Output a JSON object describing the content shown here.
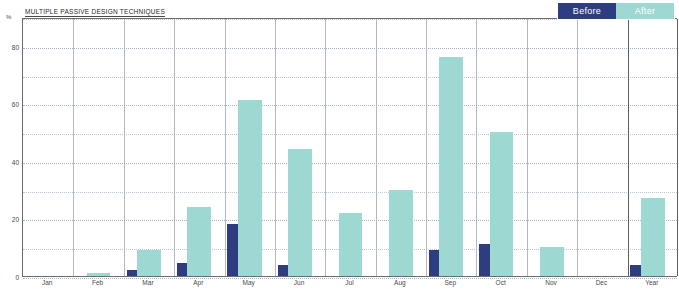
{
  "chart_data": {
    "type": "bar",
    "title": "MULTIPLE PASSIVE DESIGN TECHNIQUES",
    "xlabel": "",
    "ylabel": "%",
    "ylim": [
      0,
      90
    ],
    "grid": true,
    "legend_position": "top-right",
    "y_ticks": [
      0,
      20,
      40,
      60,
      80
    ],
    "y_gridlines": [
      0,
      10,
      20,
      30,
      40,
      50,
      60,
      70,
      80,
      90
    ],
    "categories": [
      "Jan",
      "Feb",
      "Mar",
      "Apr",
      "May",
      "Jun",
      "Jul",
      "Aug",
      "Sep",
      "Oct",
      "Nov",
      "Dec",
      "Year"
    ],
    "series": [
      {
        "name": "Before",
        "color": "#2e3d7f",
        "values": [
          0,
          0,
          2,
          4.5,
          18,
          4,
          0,
          0,
          9,
          11,
          0,
          0,
          4
        ]
      },
      {
        "name": "After",
        "color": "#9dd9d2",
        "values": [
          0,
          1,
          9,
          24,
          61,
          44,
          22,
          30,
          76,
          50,
          10,
          0,
          27
        ]
      }
    ]
  },
  "legend": {
    "items": [
      {
        "label": "Before",
        "color": "#2e3d7f"
      },
      {
        "label": "After",
        "color": "#9dd9d2"
      }
    ]
  },
  "axis": {
    "y_unit": "%"
  }
}
